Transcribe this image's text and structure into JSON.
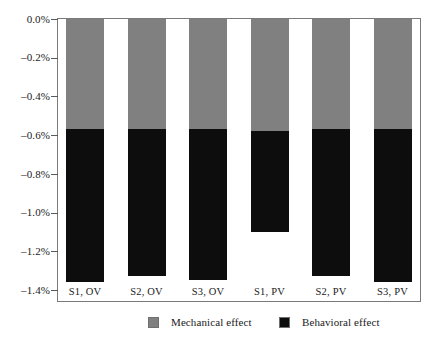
{
  "chart_data": {
    "type": "bar",
    "subtype": "stacked-column",
    "title": "",
    "subtitle": "",
    "xlabel": "",
    "ylabel": "",
    "categories": [
      "S1, OV",
      "S2, OV",
      "S3, OV",
      "S1, PV",
      "S2, PV",
      "S3, PV"
    ],
    "series": [
      {
        "name": "Mechanical effect",
        "color": "#808080",
        "values": [
          -0.57,
          -0.57,
          -0.57,
          -0.58,
          -0.57,
          -0.57
        ]
      },
      {
        "name": "Behavioral effect",
        "color": "#0d0d0d",
        "values": [
          -0.79,
          -0.76,
          -0.78,
          -0.52,
          -0.76,
          -0.79
        ]
      }
    ],
    "totals": [
      -1.36,
      -1.33,
      -1.35,
      -1.1,
      -1.33,
      -1.36
    ],
    "ylim": [
      -1.4,
      0.0
    ],
    "ytick_values": [
      0.0,
      -0.2,
      -0.4,
      -0.6,
      -0.8,
      -1.0,
      -1.2,
      -1.4
    ],
    "ytick_labels": [
      "0.0%",
      "–0.2%",
      "–0.4%",
      "–0.6%",
      "–0.8%",
      "–1.0%",
      "–1.2%",
      "–1.4%"
    ],
    "grid": false,
    "legend_position": "bottom",
    "legend": [
      {
        "label": "Mechanical effect",
        "color": "#808080"
      },
      {
        "label": "Behavioral effect",
        "color": "#0d0d0d"
      }
    ],
    "axis_color": "#7a7a7a",
    "background": "#ffffff"
  }
}
